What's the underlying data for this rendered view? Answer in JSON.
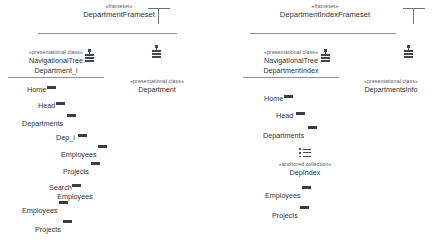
{
  "diagram": {
    "groups": [
      {
        "id": "department-frameset",
        "stereotype": "«frameset»",
        "name": "DepartmentFrameset",
        "icon": "frameset-icon",
        "classes": [
          {
            "id": "navigational-tree-department",
            "stereotype": "«presentational class»",
            "name_line1": "NavigationalTree",
            "name_line2": "Department_i",
            "icon": "document-icon",
            "links": [
              {
                "label": "Home",
                "marker": "anchor-bar"
              },
              {
                "label": "Head",
                "marker": "anchor-bar"
              },
              {
                "label": "Departments",
                "marker": "anchor-bar"
              },
              {
                "label": "Dep_i",
                "marker": "anchor-bar"
              },
              {
                "label": "Employees",
                "marker": "anchor-bar"
              },
              {
                "label": "Projects",
                "marker": "anchor-bar"
              },
              {
                "label": "Search",
                "label2": "Employees",
                "marker": "anchor-bar"
              },
              {
                "label": "Employees",
                "marker": "anchor-bar"
              },
              {
                "label": "Projects",
                "marker": "anchor-bar"
              }
            ]
          },
          {
            "id": "department",
            "stereotype": "«presentational class»",
            "name_line1": "Department",
            "icon": "document-icon"
          }
        ]
      },
      {
        "id": "department-index-frameset",
        "stereotype": "«frameset»",
        "name": "DepartmentIndexFrameset",
        "icon": "frameset-icon",
        "classes": [
          {
            "id": "navigational-tree-department-index",
            "stereotype": "«presentational class»",
            "name_line1": "NavigationalTree",
            "name_line2": "DepartmentIndex",
            "icon": "document-icon",
            "links": [
              {
                "label": "Home",
                "marker": "anchor-bar"
              },
              {
                "label": "Head",
                "marker": "anchor-bar"
              },
              {
                "label": "Departments",
                "marker": "anchor-bar"
              },
              {
                "label": "Employees",
                "marker": "anchor-bar"
              },
              {
                "label": "Projects",
                "marker": "anchor-bar"
              }
            ]
          },
          {
            "id": "dep-index-collection",
            "stereotype": "«anchored collection»",
            "name_line1": "DepIndex",
            "icon": "list-icon"
          },
          {
            "id": "departments-info",
            "stereotype": "«presentational class»",
            "name_line1": "DepartmentsInfo",
            "icon": "document-icon"
          }
        ]
      }
    ]
  },
  "colors": {
    "text": "#2f3337",
    "stereotype_text": "#54595e",
    "rule": "#8d9094",
    "marker": "#3a3e42",
    "background": "#ffffff"
  }
}
